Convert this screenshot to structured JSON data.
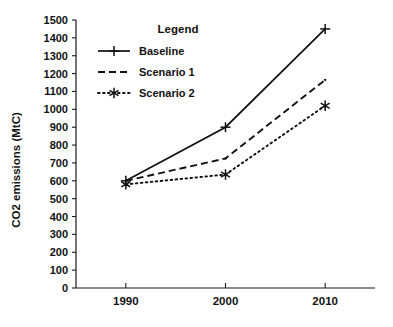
{
  "chart_data": {
    "type": "line",
    "title": "",
    "xlabel": "",
    "ylabel": "CO2 emissions (MtC)",
    "categories": [
      "1990",
      "2000",
      "2010"
    ],
    "x": [
      1990,
      2000,
      2010
    ],
    "xlim": [
      1985,
      2015
    ],
    "ylim": [
      0,
      1500
    ],
    "ytick_step": 100,
    "yticks": [
      0,
      100,
      200,
      300,
      400,
      500,
      600,
      700,
      800,
      900,
      1000,
      1100,
      1200,
      1300,
      1400,
      1500
    ],
    "ytick_labels": [
      "0",
      "100",
      "200",
      "300",
      "400",
      "500",
      "600",
      "700",
      "800",
      "900",
      "1000",
      "1100",
      "1200",
      "1300",
      "1400",
      "1500"
    ],
    "grid": false,
    "legend_position": "inside-upper-center",
    "legend_title": "Legend",
    "series": [
      {
        "name": "Baseline",
        "values": [
          600,
          900,
          1450
        ],
        "style": "solid",
        "marker": "plus",
        "color": "#111111"
      },
      {
        "name": "Scenario 1",
        "values": [
          600,
          725,
          1165
        ],
        "style": "dashed",
        "marker": "none",
        "color": "#111111"
      },
      {
        "name": "Scenario 2",
        "values": [
          580,
          635,
          1020
        ],
        "style": "dotted",
        "marker": "asterisk",
        "color": "#111111"
      }
    ]
  },
  "figure": {
    "background_color": "#ffffff",
    "axis_color": "#1a1a1a",
    "text_color": "#121212"
  }
}
